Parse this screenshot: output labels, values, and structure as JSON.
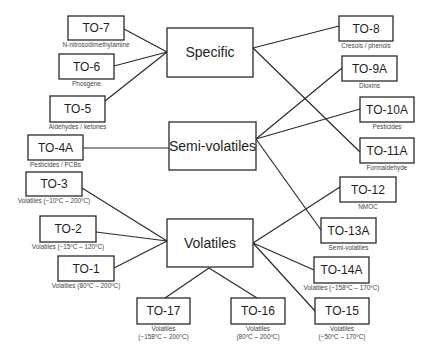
{
  "hubs": [
    {
      "id": "specific",
      "label": "Specific"
    },
    {
      "id": "semi",
      "label": "Semi-volatiles"
    },
    {
      "id": "volatiles",
      "label": "Volatiles"
    }
  ],
  "methods": [
    {
      "id": "TO-7",
      "label": "TO-7",
      "desc": [
        "N-nitrosodimethylamine"
      ],
      "hub": "specific"
    },
    {
      "id": "TO-6",
      "label": "TO-6",
      "desc": [
        "Phosgene"
      ],
      "hub": "specific"
    },
    {
      "id": "TO-5",
      "label": "TO-5",
      "desc": [
        "Aldehydes / ketones"
      ],
      "hub": "specific"
    },
    {
      "id": "TO-4A",
      "label": "TO-4A",
      "desc": [
        "Pesticides / PCBs"
      ],
      "hub": "semi"
    },
    {
      "id": "TO-3",
      "label": "TO-3",
      "desc": [
        "Volatiles (−10ºC – 200ºC)"
      ],
      "hub": "volatiles"
    },
    {
      "id": "TO-2",
      "label": "TO-2",
      "desc": [
        "Volatiles (−15ºC – 120ºC)"
      ],
      "hub": "volatiles"
    },
    {
      "id": "TO-1",
      "label": "TO-1",
      "desc": [
        "Volatiles (80ºC – 200ºC)"
      ],
      "hub": "volatiles"
    },
    {
      "id": "TO-17",
      "label": "TO-17",
      "desc": [
        "Volatiles",
        "(−158ºC – 200ºC)"
      ],
      "hub": "volatiles"
    },
    {
      "id": "TO-16",
      "label": "TO-16",
      "desc": [
        "Volatiles",
        "(80ºC – 200ºC)"
      ],
      "hub": "volatiles"
    },
    {
      "id": "TO-8",
      "label": "TO-8",
      "desc": [
        "Cresols / phenols"
      ],
      "hub": "specific"
    },
    {
      "id": "TO-9A",
      "label": "TO-9A",
      "desc": [
        "Dioxins"
      ],
      "hub": "semi"
    },
    {
      "id": "TO-10A",
      "label": "TO-10A",
      "desc": [
        "Pesticides"
      ],
      "hub": "semi"
    },
    {
      "id": "TO-11A",
      "label": "TO-11A",
      "desc": [
        "Formaldehyde"
      ],
      "hub": "specific"
    },
    {
      "id": "TO-12",
      "label": "TO-12",
      "desc": [
        "NMOC"
      ],
      "hub": "volatiles"
    },
    {
      "id": "TO-13A",
      "label": "TO-13A",
      "desc": [
        "Semi-volatiles"
      ],
      "hub": "semi"
    },
    {
      "id": "TO-14A",
      "label": "TO-14A",
      "desc": [
        "Volatiles (−158ºC – 170ºC)"
      ],
      "hub": "volatiles"
    },
    {
      "id": "TO-15",
      "label": "TO-15",
      "desc": [
        "Volatiles",
        "(−50ºC – 170ºC)"
      ],
      "hub": "volatiles"
    }
  ]
}
